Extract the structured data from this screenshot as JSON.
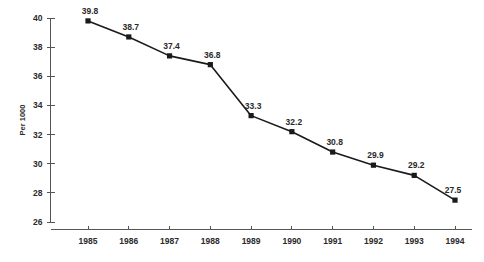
{
  "chart_data": {
    "type": "line",
    "title": "",
    "subtitle": "",
    "xlabel": "",
    "ylabel": "Per 1000",
    "categories": [
      "1985",
      "1986",
      "1987",
      "1988",
      "1989",
      "1990",
      "1991",
      "1992",
      "1993",
      "1994"
    ],
    "values": [
      39.8,
      38.7,
      37.4,
      36.8,
      33.3,
      32.2,
      30.8,
      29.9,
      29.2,
      27.5
    ],
    "point_labels": [
      "39.8",
      "38.7",
      "37.4",
      "36.8",
      "33.3",
      "32.2",
      "30.8",
      "29.9",
      "29.2",
      "27.5"
    ],
    "ylim": [
      26,
      40
    ],
    "yticks": [
      26,
      28,
      30,
      32,
      34,
      36,
      38,
      40
    ],
    "ytick_labels": [
      "26",
      "28",
      "30",
      "32",
      "34",
      "36",
      "38",
      "40"
    ],
    "grid": false,
    "legend": "none",
    "marker": "square",
    "series_color": "#1a1a1a",
    "axis_color": "#555555"
  }
}
